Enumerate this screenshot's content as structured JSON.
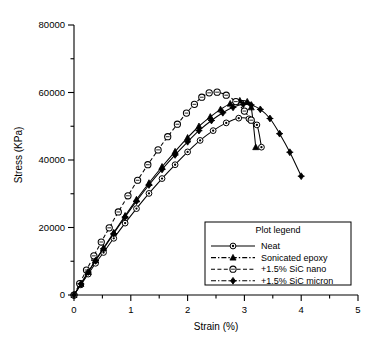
{
  "chart_data": {
    "type": "line",
    "title": "",
    "xlabel": "Strain (%)",
    "ylabel": "Stress (KPa)",
    "xlim": [
      0,
      5
    ],
    "ylim": [
      0,
      80000
    ],
    "xticks": [
      0,
      1,
      2,
      3,
      4,
      5
    ],
    "xticklabels": [
      "0",
      "1",
      "2",
      "3",
      "4",
      "5"
    ],
    "xminorticks": [
      0.5,
      1.5,
      2.5,
      3.5,
      4.5
    ],
    "yticks": [
      0,
      20000,
      40000,
      60000,
      80000
    ],
    "yticklabels": [
      "0",
      "20000",
      "40000",
      "60000",
      "80000"
    ],
    "yminorticks": [
      10000,
      30000,
      50000,
      70000
    ],
    "grid": false,
    "legend_position": "lower right",
    "legend_title": "Plot legend",
    "series": [
      {
        "name": "Neat",
        "marker": "circle-dot",
        "linestyle": "solid",
        "x": [
          0.0,
          0.12,
          0.25,
          0.38,
          0.52,
          0.7,
          0.9,
          1.1,
          1.32,
          1.55,
          1.78,
          2.0,
          2.22,
          2.45,
          2.68,
          2.9,
          3.08,
          3.22,
          3.3
        ],
        "y": [
          0,
          3000,
          6200,
          9400,
          12600,
          16800,
          21300,
          25600,
          30100,
          34500,
          38600,
          42400,
          45800,
          48700,
          51000,
          52400,
          52200,
          50400,
          43800
        ]
      },
      {
        "name": "Sonicated epoxy",
        "marker": "triangle",
        "linestyle": "solid",
        "x": [
          0.0,
          0.12,
          0.25,
          0.38,
          0.52,
          0.7,
          0.9,
          1.1,
          1.32,
          1.55,
          1.78,
          2.0,
          2.2,
          2.4,
          2.58,
          2.75,
          2.92,
          3.05,
          3.12,
          3.2
        ],
        "y": [
          0,
          3300,
          6800,
          10300,
          13900,
          18500,
          23500,
          28300,
          33200,
          38000,
          42500,
          46600,
          50000,
          52800,
          55000,
          56700,
          57600,
          57300,
          55600,
          43800
        ]
      },
      {
        "name": "+1.5% SiC nano",
        "marker": "circle-open",
        "linestyle": "dashed",
        "x": [
          0.0,
          0.1,
          0.22,
          0.35,
          0.48,
          0.62,
          0.78,
          0.95,
          1.12,
          1.3,
          1.48,
          1.65,
          1.82,
          1.98,
          2.12,
          2.25,
          2.38,
          2.52,
          2.68,
          2.85,
          3.0,
          3.12
        ],
        "y": [
          0,
          3400,
          7400,
          11600,
          15700,
          19900,
          24600,
          29400,
          34000,
          38600,
          43000,
          46900,
          50600,
          53900,
          56500,
          58600,
          59900,
          60100,
          59200,
          57300,
          54500,
          51800
        ]
      },
      {
        "name": "+1.5% SiC micron",
        "marker": "diamond-cross",
        "linestyle": "solid",
        "x": [
          0.0,
          0.12,
          0.25,
          0.38,
          0.52,
          0.7,
          0.9,
          1.1,
          1.32,
          1.55,
          1.78,
          2.0,
          2.2,
          2.42,
          2.62,
          2.8,
          2.98,
          3.12,
          3.28,
          3.45,
          3.62,
          3.8,
          4.0
        ],
        "y": [
          0,
          3300,
          6800,
          10200,
          13700,
          18200,
          23100,
          27800,
          32600,
          37200,
          41500,
          45400,
          48700,
          51700,
          54000,
          55600,
          56500,
          56300,
          55000,
          52300,
          47800,
          42300,
          35200
        ]
      }
    ],
    "legend_entries": [
      {
        "label": "Neat",
        "marker": "circle-dot",
        "linestyle": "solid"
      },
      {
        "label": "Sonicated epoxy",
        "marker": "triangle",
        "linestyle": "dash-dot"
      },
      {
        "label": "+1.5% SiC nano",
        "marker": "circle-open",
        "linestyle": "dashed"
      },
      {
        "label": "+1.5% SiC micron",
        "marker": "diamond-cross",
        "linestyle": "dash-dot"
      }
    ]
  },
  "colors": {
    "foreground": "#000000",
    "background": "#ffffff"
  }
}
